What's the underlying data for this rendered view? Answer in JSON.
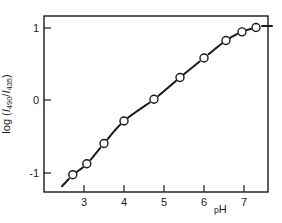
{
  "figure": {
    "background_color": "#ffffff",
    "ink_color": "#1a1a1a"
  },
  "axes": {
    "x_title_prefix": "p",
    "x_title_suffix": "H",
    "y_title_prefix": "log (",
    "y_title_i1": "I",
    "y_title_sub1": "490",
    "y_title_slash": "/",
    "y_title_i2": "I",
    "y_title_sub2": "435",
    "y_title_suffix": ")"
  },
  "chart_data": {
    "type": "line",
    "title": "",
    "subtitle": "",
    "xlabel": "pH",
    "ylabel": "log (I490/I435)",
    "xlim": [
      2.35,
      7.95
    ],
    "ylim": [
      -1.22,
      1.2
    ],
    "xticks": [
      3,
      4,
      5,
      6,
      7
    ],
    "xticklabels": [
      "3",
      "4",
      "5",
      "6",
      "7"
    ],
    "yticks": [
      1,
      0,
      -1
    ],
    "yticklabels": [
      "1",
      "0",
      "-1"
    ],
    "grid": false,
    "legend": null,
    "marker": "open-circle",
    "series": [
      {
        "name": "log (I490/I435) vs pH",
        "x": [
          2.72,
          3.07,
          3.5,
          4.0,
          4.75,
          5.4,
          6.0,
          6.55,
          6.95,
          7.3
        ],
        "y": [
          -1.03,
          -0.88,
          -0.6,
          -0.29,
          0.01,
          0.31,
          0.58,
          0.82,
          0.94,
          1.0
        ]
      }
    ],
    "annotations": [
      {
        "kind": "lead-dash",
        "x_from": 2.45,
        "y_from": -1.19,
        "x_to": 2.62,
        "y_to": -1.09
      },
      {
        "kind": "trail-dash",
        "x_from": 7.45,
        "y_from": 1.02,
        "x_to": 7.7,
        "y_to": 1.02
      }
    ]
  }
}
